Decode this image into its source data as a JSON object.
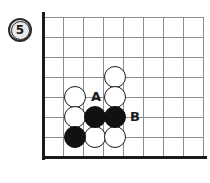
{
  "figure": {
    "badge_label": "5",
    "badge_name": "figure-number-badge"
  },
  "board": {
    "type": "go-board-diagram",
    "origin_x": 43,
    "origin_y": 17,
    "cell_size": 20,
    "cols": 8,
    "rows": 7,
    "grid_color": "#8c8c8c",
    "edge_color": "#1a1a1a",
    "left_edge": true,
    "bottom_edge": true,
    "stone_radius": 11
  },
  "stones": [
    {
      "id": "w1",
      "color": "white",
      "col": 4,
      "row": 3,
      "x": 115,
      "y": 77
    },
    {
      "id": "w2",
      "color": "white",
      "col": 2,
      "row": 4,
      "x": 75,
      "y": 97
    },
    {
      "id": "w3",
      "color": "white",
      "col": 4,
      "row": 4,
      "x": 115,
      "y": 97
    },
    {
      "id": "w4",
      "color": "white",
      "col": 2,
      "row": 5,
      "x": 75,
      "y": 117
    },
    {
      "id": "b1",
      "color": "black",
      "col": 3,
      "row": 5,
      "x": 95,
      "y": 117
    },
    {
      "id": "b2",
      "color": "black",
      "col": 4,
      "row": 5,
      "x": 115,
      "y": 117
    },
    {
      "id": "b3",
      "color": "black",
      "col": 2,
      "row": 6,
      "x": 75,
      "y": 137
    },
    {
      "id": "w5",
      "color": "white",
      "col": 3,
      "row": 6,
      "x": 95,
      "y": 137
    },
    {
      "id": "w6",
      "color": "white",
      "col": 4,
      "row": 6,
      "x": 115,
      "y": 137
    }
  ],
  "markers": [
    {
      "id": "A",
      "label": "A",
      "x": 96,
      "y": 96
    },
    {
      "id": "B",
      "label": "B",
      "x": 135,
      "y": 116
    }
  ],
  "colors": {
    "black_stone": "#111111",
    "white_stone": "#ffffff",
    "stone_outline": "#1a1a1a",
    "grid": "#8c8c8c",
    "border": "#1a1a1a",
    "background": "#ffffff",
    "badge_fill": "#e9e9e9"
  }
}
